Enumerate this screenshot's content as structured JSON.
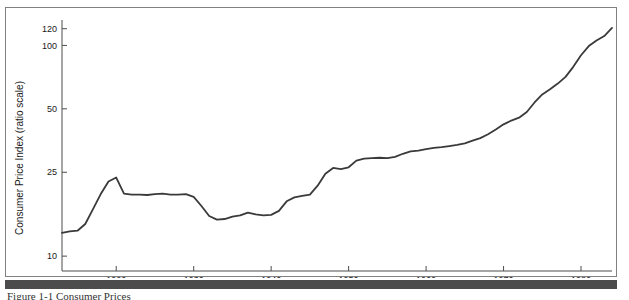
{
  "figure": {
    "caption": "Figure 1-1 Consumer Prices",
    "frame_color": "#808080",
    "bar_color": "#4c4c4c",
    "line_color": "#3a3a3a",
    "background": "#ffffff"
  },
  "chart_data": {
    "type": "line",
    "title": "",
    "subtitle": "",
    "xlabel": "",
    "ylabel": "Consumer Price Index (ratio scale)",
    "yscale": "log",
    "xscale": "linear",
    "grid": false,
    "legend": null,
    "xlim": [
      1913,
      1984
    ],
    "ylim": [
      8.5,
      132
    ],
    "xticks": [
      1920,
      1930,
      1940,
      1950,
      1960,
      1970,
      1980
    ],
    "xtick_labels": [
      "1920",
      "1930",
      "1940",
      "1950",
      "1960",
      "1970",
      "1980"
    ],
    "yticks": [
      10,
      25,
      50,
      100,
      120
    ],
    "ytick_labels": [
      "10",
      "25",
      "50",
      "100",
      "120"
    ],
    "series": [
      {
        "name": "Consumer Price Index",
        "x": [
          1913,
          1914,
          1915,
          1916,
          1917,
          1918,
          1919,
          1920,
          1921,
          1922,
          1923,
          1924,
          1925,
          1926,
          1927,
          1928,
          1929,
          1930,
          1931,
          1932,
          1933,
          1934,
          1935,
          1936,
          1937,
          1938,
          1939,
          1940,
          1941,
          1942,
          1943,
          1944,
          1945,
          1946,
          1947,
          1948,
          1949,
          1950,
          1951,
          1952,
          1953,
          1954,
          1955,
          1956,
          1957,
          1958,
          1959,
          1960,
          1961,
          1962,
          1963,
          1964,
          1965,
          1966,
          1967,
          1968,
          1969,
          1970,
          1971,
          1972,
          1973,
          1974,
          1975,
          1976,
          1977,
          1978,
          1979,
          1980,
          1981,
          1982,
          1983,
          1984
        ],
        "y": [
          12.9,
          13.1,
          13.2,
          14.2,
          16.7,
          19.7,
          22.6,
          23.6,
          19.8,
          19.6,
          19.6,
          19.5,
          19.7,
          19.8,
          19.6,
          19.6,
          19.7,
          19.1,
          17.3,
          15.5,
          14.9,
          15.0,
          15.4,
          15.6,
          16.1,
          15.8,
          15.6,
          15.7,
          16.4,
          18.2,
          19.0,
          19.3,
          19.6,
          21.6,
          24.6,
          26.2,
          25.9,
          26.4,
          28.4,
          29.0,
          29.2,
          29.3,
          29.2,
          29.6,
          30.6,
          31.4,
          31.7,
          32.2,
          32.6,
          32.9,
          33.3,
          33.7,
          34.3,
          35.3,
          36.3,
          37.9,
          39.9,
          42.2,
          44.0,
          45.4,
          48.3,
          53.6,
          58.5,
          61.9,
          65.9,
          70.9,
          79.1,
          89.8,
          99.3,
          105.4,
          110.8,
          121.0
        ]
      }
    ],
    "annotations": []
  }
}
